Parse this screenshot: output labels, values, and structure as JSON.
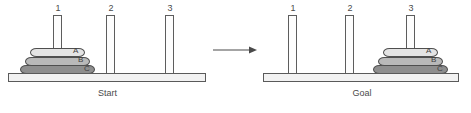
{
  "diagram": {
    "transition_icon": "right-arrow-icon"
  },
  "panels": [
    {
      "id": "start",
      "caption": "Start",
      "pegs": [
        {
          "number": "1",
          "disks": [
            "A",
            "B",
            "C"
          ]
        },
        {
          "number": "2",
          "disks": []
        },
        {
          "number": "3",
          "disks": []
        }
      ]
    },
    {
      "id": "goal",
      "caption": "Goal",
      "pegs": [
        {
          "number": "1",
          "disks": []
        },
        {
          "number": "2",
          "disks": []
        },
        {
          "number": "3",
          "disks": [
            "A",
            "B",
            "C"
          ]
        }
      ]
    }
  ],
  "disks": [
    {
      "label": "A",
      "size": "small",
      "color": "#e4e4e4"
    },
    {
      "label": "B",
      "size": "medium",
      "color": "#b9b9b9"
    },
    {
      "label": "C",
      "size": "large",
      "color": "#8e8e8e"
    }
  ],
  "colors": {
    "outline": "#4f4f4f",
    "peg_fill": "#fdfdfd",
    "base_fill": "#f2f2f2",
    "background": "#ffffff",
    "text": "#4a4a4a"
  }
}
